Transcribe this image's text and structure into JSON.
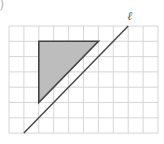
{
  "figure": {
    "corner_mark": ")",
    "grid": {
      "left": 9,
      "top": 26,
      "cell_w": 14.9,
      "cell_h": 15.3,
      "cols": 10,
      "rows": 7,
      "line_color": "#d6d6d6"
    },
    "triangle": {
      "vertices_grid": [
        [
          2,
          1
        ],
        [
          6,
          1
        ],
        [
          2,
          5
        ]
      ],
      "fill": "#bdbdbd",
      "stroke": "#444444"
    },
    "line": {
      "label": "ℓ",
      "from_grid": [
        1,
        7
      ],
      "to_grid": [
        8,
        0
      ],
      "stroke": "#444444"
    }
  }
}
